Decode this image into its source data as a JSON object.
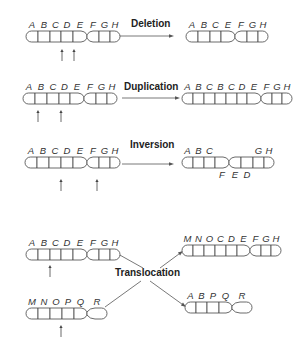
{
  "colors": {
    "light": "#d9d9d9",
    "medium": "#c8c8c8",
    "dark": "#8c8c8c",
    "outline": "#444444"
  },
  "operations": [
    {
      "name": "deletion",
      "label": "Deletion",
      "label_pos": [
        131,
        27
      ],
      "arrows": [
        {
          "from": [
            114,
            36
          ],
          "to": [
            174,
            36
          ]
        }
      ],
      "chromosomes": [
        {
          "id": "deletion-original",
          "x": 26,
          "y": 31,
          "h": 11,
          "bands": [
            {
              "label": "A",
              "w": 12,
              "fill": ""
            },
            {
              "label": "B",
              "w": 12,
              "fill": ""
            },
            {
              "label": "C",
              "w": 11,
              "fill": ""
            },
            {
              "label": "D",
              "w": 12,
              "fill": "light"
            },
            {
              "label": "E",
              "w": 14,
              "fill": "",
              "taper": "right"
            },
            {
              "label": "F",
              "w": 12,
              "fill": "",
              "taper": "left"
            },
            {
              "label": "G",
              "w": 11,
              "fill": ""
            },
            {
              "label": "H",
              "w": 10,
              "fill": ""
            }
          ],
          "markers": [
            62,
            74
          ],
          "marker_y": [
            49,
            61
          ]
        },
        {
          "id": "deletion-result",
          "x": 186,
          "y": 31,
          "h": 11,
          "bands": [
            {
              "label": "A",
              "w": 12,
              "fill": ""
            },
            {
              "label": "B",
              "w": 12,
              "fill": ""
            },
            {
              "label": "C",
              "w": 11,
              "fill": ""
            },
            {
              "label": "E",
              "w": 14,
              "fill": "",
              "taper": "right"
            },
            {
              "label": "F",
              "w": 12,
              "fill": "",
              "taper": "left"
            },
            {
              "label": "G",
              "w": 11,
              "fill": ""
            },
            {
              "label": "H",
              "w": 10,
              "fill": ""
            }
          ]
        }
      ]
    },
    {
      "name": "duplication",
      "label": "Duplication",
      "label_pos": [
        124,
        90
      ],
      "arrows": [
        {
          "from": [
            122,
            98
          ],
          "to": [
            180,
            98
          ]
        }
      ],
      "chromosomes": [
        {
          "id": "duplication-original",
          "x": 23,
          "y": 93,
          "h": 11,
          "bands": [
            {
              "label": "A",
              "w": 12,
              "fill": ""
            },
            {
              "label": "B",
              "w": 12,
              "fill": "light"
            },
            {
              "label": "C",
              "w": 12,
              "fill": "light"
            },
            {
              "label": "D",
              "w": 11,
              "fill": ""
            },
            {
              "label": "E",
              "w": 14,
              "fill": "",
              "taper": "right"
            },
            {
              "label": "F",
              "w": 12,
              "fill": "",
              "taper": "left"
            },
            {
              "label": "G",
              "w": 11,
              "fill": ""
            },
            {
              "label": "H",
              "w": 10,
              "fill": ""
            }
          ],
          "markers": [
            38,
            61
          ],
          "marker_y": [
            110,
            122
          ]
        },
        {
          "id": "duplication-result",
          "x": 182,
          "y": 93,
          "h": 11,
          "bands": [
            {
              "label": "A",
              "w": 11,
              "fill": ""
            },
            {
              "label": "B",
              "w": 11,
              "fill": "light"
            },
            {
              "label": "C",
              "w": 11,
              "fill": "light"
            },
            {
              "label": "B",
              "w": 11,
              "fill": "light"
            },
            {
              "label": "C",
              "w": 11,
              "fill": "light"
            },
            {
              "label": "D",
              "w": 10,
              "fill": ""
            },
            {
              "label": "E",
              "w": 14,
              "fill": "",
              "taper": "right"
            },
            {
              "label": "F",
              "w": 11,
              "fill": "",
              "taper": "left"
            },
            {
              "label": "G",
              "w": 10,
              "fill": ""
            },
            {
              "label": "H",
              "w": 10,
              "fill": ""
            }
          ]
        }
      ]
    },
    {
      "name": "inversion",
      "label": "Inversion",
      "label_pos": [
        130,
        148
      ],
      "arrows": [
        {
          "from": [
            122,
            164
          ],
          "to": [
            174,
            164
          ]
        }
      ],
      "chromosomes": [
        {
          "id": "inversion-original",
          "x": 25,
          "y": 157,
          "h": 11,
          "bands": [
            {
              "label": "A",
              "w": 12,
              "fill": ""
            },
            {
              "label": "B",
              "w": 12,
              "fill": ""
            },
            {
              "label": "C",
              "w": 12,
              "fill": ""
            },
            {
              "label": "D",
              "w": 12,
              "fill": "dark"
            },
            {
              "label": "E",
              "w": 14,
              "fill": "light",
              "taper": "right"
            },
            {
              "label": "F",
              "w": 12,
              "fill": "light",
              "taper": "left"
            },
            {
              "label": "G",
              "w": 11,
              "fill": ""
            },
            {
              "label": "H",
              "w": 10,
              "fill": ""
            }
          ],
          "markers": [
            61,
            97
          ],
          "marker_y": [
            179,
            191
          ]
        },
        {
          "id": "inversion-result",
          "x": 182,
          "y": 157,
          "h": 11,
          "label_offsets": {
            "below": [
              "F",
              "E",
              "D"
            ]
          },
          "bands": [
            {
              "label": "A",
              "w": 11,
              "fill": ""
            },
            {
              "label": "B",
              "w": 11,
              "fill": ""
            },
            {
              "label": "C",
              "w": 11,
              "fill": ""
            },
            {
              "label": "F",
              "w": 14,
              "fill": "light",
              "taper": "right",
              "below": true
            },
            {
              "label": "E",
              "w": 12,
              "fill": "light",
              "taper": "left",
              "below": true
            },
            {
              "label": "D",
              "w": 12,
              "fill": "dark",
              "below": true
            },
            {
              "label": "G",
              "w": 11,
              "fill": ""
            },
            {
              "label": "H",
              "w": 10,
              "fill": ""
            }
          ]
        }
      ]
    },
    {
      "name": "translocation",
      "label": "Translocation",
      "label_pos": [
        115,
        276
      ],
      "arrows": [
        {
          "from": [
            119,
            256
          ],
          "to": [
            116,
            256
          ],
          "kind": "line-only",
          "line": [
            [
              118,
              254
            ],
            [
              143,
              268
            ]
          ]
        },
        {
          "from": [
            106,
            307
          ],
          "to": [
            106,
            307
          ],
          "kind": "line-only",
          "line": [
            [
              105,
              307
            ],
            [
              141,
              281
            ]
          ]
        },
        {
          "from": [
            160,
            268
          ],
          "to": [
            183,
            251
          ]
        },
        {
          "from": [
            150,
            281
          ],
          "to": [
            186,
            307
          ]
        }
      ],
      "chromosomes": [
        {
          "id": "translocation-original-1",
          "x": 26,
          "y": 249,
          "h": 11,
          "bands": [
            {
              "label": "A",
              "w": 12,
              "fill": "light"
            },
            {
              "label": "B",
              "w": 12,
              "fill": "light"
            },
            {
              "label": "C",
              "w": 11,
              "fill": ""
            },
            {
              "label": "D",
              "w": 12,
              "fill": ""
            },
            {
              "label": "E",
              "w": 14,
              "fill": "",
              "taper": "right"
            },
            {
              "label": "F",
              "w": 12,
              "fill": "",
              "taper": "left"
            },
            {
              "label": "G",
              "w": 11,
              "fill": ""
            },
            {
              "label": "H",
              "w": 10,
              "fill": ""
            }
          ],
          "markers": [
            50
          ],
          "marker_y": [
            265,
            277
          ]
        },
        {
          "id": "translocation-original-2",
          "x": 26,
          "y": 308,
          "h": 11,
          "bands": [
            {
              "label": "M",
              "w": 12,
              "fill": "dark"
            },
            {
              "label": "N",
              "w": 12,
              "fill": "dark"
            },
            {
              "label": "O",
              "w": 12,
              "fill": "dark"
            },
            {
              "label": "P",
              "w": 12,
              "fill": ""
            },
            {
              "label": "Q",
              "w": 13,
              "fill": "",
              "taper": "right"
            },
            {
              "label": "R",
              "w": 20,
              "fill": "",
              "taper": "left",
              "rounded": true
            }
          ],
          "markers": [
            61
          ],
          "marker_y": [
            325,
            337
          ]
        },
        {
          "id": "translocation-result-1",
          "x": 182,
          "y": 245,
          "h": 11,
          "bands": [
            {
              "label": "M",
              "w": 11,
              "fill": "dark"
            },
            {
              "label": "N",
              "w": 11,
              "fill": "dark"
            },
            {
              "label": "O",
              "w": 11,
              "fill": "dark"
            },
            {
              "label": "C",
              "w": 11,
              "fill": ""
            },
            {
              "label": "D",
              "w": 11,
              "fill": ""
            },
            {
              "label": "E",
              "w": 13,
              "fill": "",
              "taper": "right"
            },
            {
              "label": "F",
              "w": 11,
              "fill": "",
              "taper": "left"
            },
            {
              "label": "G",
              "w": 10,
              "fill": ""
            },
            {
              "label": "H",
              "w": 10,
              "fill": ""
            }
          ]
        },
        {
          "id": "translocation-result-2",
          "x": 185,
          "y": 302,
          "h": 11,
          "bands": [
            {
              "label": "A",
              "w": 11,
              "fill": "light"
            },
            {
              "label": "B",
              "w": 11,
              "fill": "light"
            },
            {
              "label": "P",
              "w": 12,
              "fill": ""
            },
            {
              "label": "Q",
              "w": 13,
              "fill": "",
              "taper": "right"
            },
            {
              "label": "R",
              "w": 20,
              "fill": "",
              "taper": "left",
              "rounded": true
            }
          ]
        }
      ]
    }
  ]
}
